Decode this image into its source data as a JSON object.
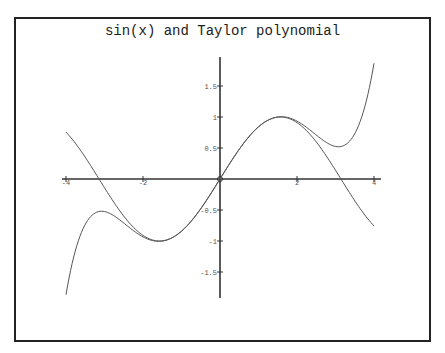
{
  "chart_data": {
    "type": "line",
    "title": "sin(x) and Taylor polynomial",
    "xlabel": "",
    "ylabel": "",
    "xlim": [
      -4,
      4
    ],
    "ylim": [
      -1.92,
      1.9
    ],
    "grid": false,
    "legend": null,
    "x_ticks": [
      -4,
      -2,
      0,
      2,
      4
    ],
    "x_tick_labels": [
      "-4",
      "-2",
      "0",
      "2",
      "4"
    ],
    "y_ticks": [
      -1.5,
      -1,
      -0.5,
      0.5,
      1,
      1.5
    ],
    "y_tick_labels": [
      "-1.5",
      "-1",
      "-0.5",
      "0.5",
      "1",
      "1.5"
    ],
    "series": [
      {
        "name": "sin(x)",
        "x": [
          -4,
          -3.5,
          -3,
          -2.5,
          -2,
          -1.5,
          -1,
          -0.5,
          0,
          0.5,
          1,
          1.5,
          2,
          2.5,
          3,
          3.5,
          4
        ],
        "values": [
          0.757,
          0.351,
          -0.141,
          -0.598,
          -0.909,
          -0.997,
          -0.841,
          -0.479,
          0,
          0.479,
          0.841,
          0.997,
          0.909,
          0.598,
          0.141,
          -0.351,
          -0.757
        ]
      },
      {
        "name": "Taylor polynomial (x - x^3/6 + x^5/120)",
        "x": [
          -4,
          -3.5,
          -3,
          -2.5,
          -2,
          -1.5,
          -1,
          -0.5,
          0,
          0.5,
          1,
          1.5,
          2,
          2.5,
          3,
          3.5,
          4
        ],
        "values": [
          -1.867,
          -0.665,
          -0.525,
          -0.699,
          -0.933,
          -0.9995,
          -0.842,
          -0.479,
          0,
          0.479,
          0.842,
          0.9995,
          0.933,
          0.699,
          0.525,
          0.665,
          1.867
        ]
      }
    ]
  }
}
